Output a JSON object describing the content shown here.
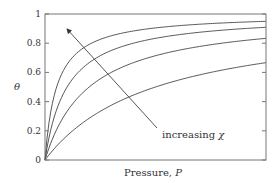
{
  "chart_data": {
    "type": "line",
    "title": "",
    "xlabel": "Pressure, P",
    "ylabel": "θ",
    "xlim": [
      0,
      1
    ],
    "ylim": [
      0,
      1
    ],
    "yticks": [
      "0",
      "0.2",
      "0.4",
      "0.6",
      "0.8",
      "1"
    ],
    "ytick_values": [
      0,
      0.2,
      0.4,
      0.6,
      0.8,
      1.0
    ],
    "xticks": [],
    "grid": false,
    "legend": null,
    "annotations": [
      {
        "text": "increasing χ",
        "arrow_from": [
          0.51,
          0.22
        ],
        "arrow_to": [
          0.1,
          0.9
        ]
      }
    ],
    "series": [
      {
        "name": "curve-1 (highest χ)",
        "K": 19,
        "x": [
          0,
          0.05,
          0.1,
          0.2,
          0.4,
          0.6,
          0.8,
          1.0
        ],
        "values": [
          0,
          0.49,
          0.66,
          0.79,
          0.88,
          0.92,
          0.94,
          0.95
        ]
      },
      {
        "name": "curve-2",
        "K": 10,
        "x": [
          0,
          0.05,
          0.1,
          0.2,
          0.4,
          0.6,
          0.8,
          1.0
        ],
        "values": [
          0,
          0.33,
          0.5,
          0.67,
          0.8,
          0.86,
          0.89,
          0.91
        ]
      },
      {
        "name": "curve-3",
        "K": 5,
        "x": [
          0,
          0.05,
          0.1,
          0.2,
          0.4,
          0.6,
          0.8,
          1.0
        ],
        "values": [
          0,
          0.2,
          0.33,
          0.5,
          0.67,
          0.75,
          0.8,
          0.83
        ]
      },
      {
        "name": "curve-4 (lowest χ)",
        "K": 2,
        "x": [
          0,
          0.05,
          0.1,
          0.2,
          0.4,
          0.6,
          0.8,
          1.0
        ],
        "values": [
          0,
          0.09,
          0.17,
          0.29,
          0.44,
          0.55,
          0.62,
          0.67
        ]
      }
    ]
  },
  "labels": {
    "ylabel": "θ",
    "xlabel_prefix": "Pressure, ",
    "xlabel_var": "P",
    "annotation_prefix": "increasing ",
    "annotation_var": "χ"
  }
}
